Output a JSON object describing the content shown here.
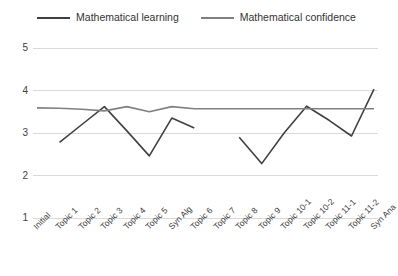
{
  "chart_data": {
    "type": "line",
    "title": "",
    "xlabel": "",
    "ylabel": "",
    "ylim": [
      1,
      5
    ],
    "yticks": [
      1,
      2,
      3,
      4,
      5
    ],
    "grid": true,
    "legend_position": "top-center",
    "categories": [
      "Initial",
      "Topic 1",
      "Topic 2",
      "Topic 3",
      "Topic 4",
      "Topic 5",
      "Syn Alg",
      "Topic 6",
      "Topic 7",
      "Topic 8",
      "Topic 9",
      "Topic 10-1",
      "Topic 10-2",
      "Topic 11-1",
      "Topic 11-2",
      "Syn Ana"
    ],
    "series": [
      {
        "name": "Mathematical learning",
        "color": "#404040",
        "values": [
          null,
          2.78,
          3.2,
          3.62,
          3.05,
          2.46,
          3.35,
          3.12,
          null,
          2.9,
          2.28,
          3.0,
          3.63,
          3.3,
          2.93,
          4.03
        ]
      },
      {
        "name": "Mathematical confidence",
        "color": "#808080",
        "values": [
          3.59,
          3.58,
          3.56,
          3.52,
          3.62,
          3.5,
          3.62,
          3.57,
          3.57,
          3.57,
          3.57,
          3.57,
          3.57,
          3.57,
          3.57,
          3.57
        ]
      }
    ]
  },
  "legend": {
    "items": [
      {
        "label": "Mathematical learning",
        "color": "#404040"
      },
      {
        "label": "Mathematical confidence",
        "color": "#808080"
      }
    ]
  },
  "axes": {
    "y_tick_labels": [
      "5",
      "4",
      "3",
      "2",
      "1"
    ],
    "x_tick_labels": [
      "Initial",
      "Topic 1",
      "Topic 2",
      "Topic 3",
      "Topic 4",
      "Topic 5",
      "Syn Alg",
      "Topic 6",
      "Topic 7",
      "Topic 8",
      "Topic 9",
      "Topic 10-1",
      "Topic 10-2",
      "Topic 11-1",
      "Topic 11-2",
      "Syn Ana"
    ]
  },
  "colors": {
    "grid": "#d9d9d9",
    "learning": "#404040",
    "confidence": "#808080",
    "text": "#404040",
    "background": "#ffffff"
  }
}
